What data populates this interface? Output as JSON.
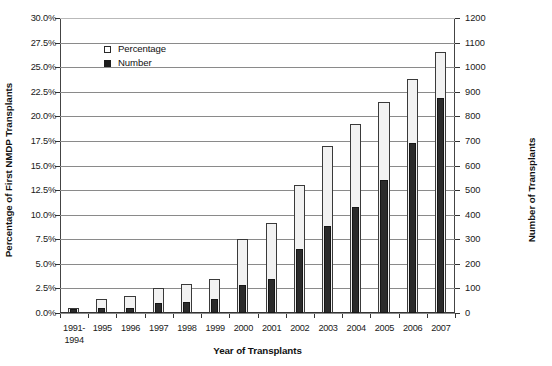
{
  "chart_data": {
    "type": "bar",
    "title": "",
    "xlabel": "Year of Transplants",
    "ylabel": "Percentage of First NMDP Transplants",
    "y2label": "Number of Transplants",
    "categories": [
      "1991-\n1994",
      "1995",
      "1996",
      "1997",
      "1998",
      "1999",
      "2000",
      "2001",
      "2002",
      "2003",
      "2004",
      "2005",
      "2006",
      "2007"
    ],
    "ylim": [
      0,
      30
    ],
    "y2lim": [
      0,
      1200
    ],
    "grid": true,
    "legend_position": "top-left",
    "y_ticks": [
      "0.0%",
      "2.5%",
      "5.0%",
      "7.5%",
      "10.0%",
      "12.5%",
      "15.0%",
      "17.5%",
      "20.0%",
      "22.5%",
      "25.0%",
      "27.5%",
      "30.0%"
    ],
    "y_tick_values": [
      0,
      2.5,
      5,
      7.5,
      10,
      12.5,
      15,
      17.5,
      20,
      22.5,
      25,
      27.5,
      30
    ],
    "y2_ticks": [
      "0",
      "100",
      "200",
      "300",
      "400",
      "500",
      "600",
      "700",
      "800",
      "900",
      "1000",
      "1100",
      "1200"
    ],
    "y2_tick_values": [
      0,
      100,
      200,
      300,
      400,
      500,
      600,
      700,
      800,
      900,
      1000,
      1100,
      1200
    ],
    "series": [
      {
        "name": "Percentage",
        "axis": "left",
        "unit": "%",
        "fill": "#f2f2f2",
        "stroke": "#3a3a3a",
        "values": [
          0.5,
          1.4,
          1.7,
          2.5,
          3.0,
          3.5,
          7.5,
          9.2,
          13.0,
          17.0,
          19.2,
          21.5,
          23.8,
          26.5
        ]
      },
      {
        "name": "Number",
        "axis": "right",
        "unit": "",
        "fill": "#2b2b2b",
        "stroke": "#161616",
        "values": [
          15,
          20,
          22,
          40,
          45,
          55,
          115,
          140,
          260,
          355,
          430,
          540,
          690,
          875
        ]
      }
    ]
  },
  "legend": {
    "items": [
      {
        "label": "Percentage",
        "swatch": "white-square-icon"
      },
      {
        "label": "Number",
        "swatch": "black-square-icon"
      }
    ]
  },
  "axes": {
    "left_title": "Percentage of First NMDP Transplants",
    "right_title": "Number of Transplants",
    "x_title": "Year of Transplants"
  }
}
